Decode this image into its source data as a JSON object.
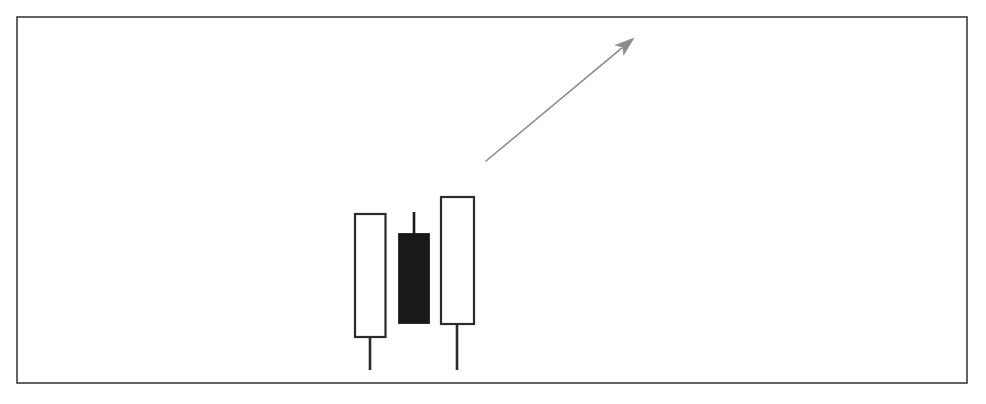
{
  "figure": {
    "title": "",
    "caption": "",
    "background_color": "#ffffff",
    "frame": {
      "name": "chart-border",
      "x": 17,
      "y": 17,
      "width": 950,
      "height": 366,
      "stroke_color": "#3c3c3c",
      "stroke_width": 1.6,
      "fill": "none"
    }
  },
  "chart_data": {
    "type": "candlestick",
    "title": "",
    "subtitle": "",
    "xlabel": "",
    "ylabel": "",
    "grid": false,
    "legend": null,
    "axis_visible": false,
    "tick_labels_visible": false,
    "pattern_name": "Bullish candlestick pattern with upward trend arrow",
    "price_axis_note": "Prices are given in pixel-space y coordinates (lower y = higher price); no numeric price axis is drawn.",
    "categories": [
      "Candle 1",
      "Candle 2",
      "Candle 3"
    ],
    "candles": [
      {
        "index": 1,
        "label": "Candle 1",
        "type": "hollow",
        "direction": "bullish",
        "fill": "#ffffff",
        "stroke": "#2b2b2b",
        "center_x": 370,
        "body_left": 355,
        "body_right": 385.5,
        "body_width": 30.5,
        "body_top_y": 214,
        "body_bottom_y": 337,
        "body_height": 123,
        "upper_wick_top_y": 214,
        "lower_wick_bottom_y": 370,
        "has_upper_wick": false,
        "has_lower_wick": true
      },
      {
        "index": 2,
        "label": "Candle 2",
        "type": "filled",
        "direction": "bearish",
        "fill": "#191919",
        "stroke": "#191919",
        "center_x": 414,
        "body_left": 399,
        "body_right": 429,
        "body_width": 30,
        "body_top_y": 234,
        "body_bottom_y": 323,
        "body_height": 89,
        "upper_wick_top_y": 212,
        "lower_wick_bottom_y": 323,
        "has_upper_wick": true,
        "has_lower_wick": false
      },
      {
        "index": 3,
        "label": "Candle 3",
        "type": "hollow",
        "direction": "bullish",
        "fill": "#ffffff",
        "stroke": "#2b2b2b",
        "center_x": 457,
        "body_left": 441,
        "body_right": 474,
        "body_width": 33,
        "body_top_y": 197,
        "body_bottom_y": 324,
        "body_height": 127,
        "upper_wick_top_y": 197,
        "lower_wick_bottom_y": 370,
        "has_upper_wick": false,
        "has_lower_wick": true
      }
    ],
    "annotations": [
      {
        "name": "trend-arrow",
        "kind": "arrow",
        "direction": "up-right",
        "meaning": "uptrend",
        "color": "#8c8c8c",
        "line_width": 1.6,
        "tail_x": 486,
        "tail_y": 161,
        "head_x": 634,
        "head_y": 38,
        "head_length": 19,
        "head_width": 13,
        "label": ""
      }
    ]
  }
}
